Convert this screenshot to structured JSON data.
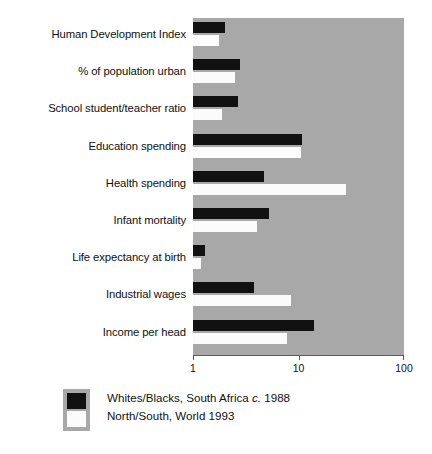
{
  "chart_data": {
    "type": "bar",
    "orientation": "horizontal",
    "title": "",
    "subtitle": "",
    "xlabel": "",
    "ylabel": "",
    "xscale": "log",
    "xlim": [
      1,
      100
    ],
    "xticks": [
      1,
      10,
      100
    ],
    "xtick_labels": [
      "1",
      "10",
      "100"
    ],
    "grid": false,
    "legend_position": "bottom-left",
    "plot_background_color": "#a8a8a8",
    "categories": [
      "Human Development Index",
      "% of population urban",
      "School student/teacher ratio",
      "Education spending",
      "Health spending",
      "Infant mortality",
      "Life expectancy at birth",
      "Industrial wages",
      "Income per head"
    ],
    "series": [
      {
        "name": "Whites/Blacks, South Africa c. 1988",
        "color": "#111111",
        "values": [
          2.0,
          2.8,
          2.65,
          10.9,
          4.7,
          5.2,
          1.3,
          3.8,
          14.0
        ]
      },
      {
        "name": "North/South, World 1993",
        "color": "#fbfbfb",
        "values": [
          1.75,
          2.5,
          1.9,
          10.6,
          28.0,
          4.0,
          1.2,
          8.5,
          7.8
        ]
      }
    ]
  },
  "legend": {
    "items": [
      {
        "swatch": "black",
        "text_before_italic": "Whites/Blacks, South Africa ",
        "italic": "c.",
        "text_after_italic": " 1988"
      },
      {
        "swatch": "white",
        "text_before_italic": "North/South, World 1993",
        "italic": "",
        "text_after_italic": ""
      }
    ]
  }
}
